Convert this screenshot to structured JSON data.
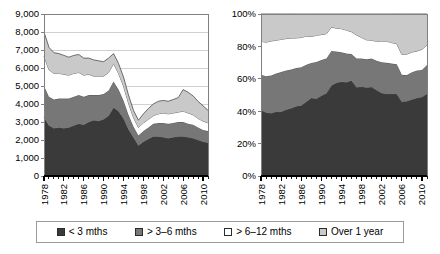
{
  "colors": {
    "series_lt3": "#3a3a3a",
    "series_3to6": "#777777",
    "series_6to12": "#ffffff",
    "series_over1y": "#c9c9c9",
    "axis": "#808080",
    "grid": "#d0d0d0",
    "outline": "#4d4d4d",
    "legend_border": "#9a9a9a"
  },
  "legend": {
    "items": [
      {
        "label": "< 3 mths",
        "swatch": "#3a3a3a",
        "icon": "legend-swatch-icon"
      },
      {
        "label": "> 3–6 mths",
        "swatch": "#777777",
        "icon": "legend-swatch-icon"
      },
      {
        "label": "> 6–12 mths",
        "swatch": "#ffffff",
        "icon": "legend-swatch-icon"
      },
      {
        "label": "Over 1 year",
        "swatch": "#c9c9c9",
        "icon": "legend-swatch-icon"
      }
    ]
  },
  "chart_data": [
    {
      "id": "absolute",
      "type": "area",
      "stacked": true,
      "title": "",
      "xlabel": "",
      "ylabel": "",
      "grid": true,
      "legend_position": "bottom",
      "ylim": [
        0,
        9000
      ],
      "ytick_labels": [
        "0",
        "1,000",
        "2,000",
        "3,000",
        "4,000",
        "5,000",
        "6,000",
        "7,000",
        "8,000",
        "9,000"
      ],
      "yticks": [
        0,
        1000,
        2000,
        3000,
        4000,
        5000,
        6000,
        7000,
        8000,
        9000
      ],
      "xlim": [
        1978,
        2011
      ],
      "xtick_labels": [
        "1978",
        "1982",
        "1986",
        "1990",
        "1994",
        "1998",
        "2002",
        "2006",
        "2010"
      ],
      "xticks": [
        1978,
        1982,
        1986,
        1990,
        1994,
        1998,
        2002,
        2006,
        2010
      ],
      "x": [
        1978,
        1979,
        1980,
        1981,
        1982,
        1983,
        1984,
        1985,
        1986,
        1987,
        1988,
        1989,
        1990,
        1991,
        1992,
        1993,
        1994,
        1995,
        1996,
        1997,
        1998,
        1999,
        2000,
        2001,
        2002,
        2003,
        2004,
        2005,
        2006,
        2007,
        2008,
        2009,
        2010,
        2011
      ],
      "series": [
        {
          "name": "< 3 mths",
          "color": "#3a3a3a",
          "values": [
            3250,
            2800,
            2650,
            2700,
            2650,
            2700,
            2800,
            2900,
            2850,
            3000,
            3100,
            3050,
            3150,
            3350,
            3800,
            3600,
            3200,
            2600,
            2150,
            1700,
            1900,
            2050,
            2200,
            2200,
            2150,
            2100,
            2150,
            2200,
            2200,
            2150,
            2100,
            2000,
            1900,
            1850
          ]
        },
        {
          "name": "> 3–6 mths",
          "color": "#777777",
          "values": [
            1750,
            1600,
            1600,
            1600,
            1650,
            1600,
            1600,
            1600,
            1550,
            1500,
            1400,
            1450,
            1400,
            1400,
            1450,
            1200,
            1000,
            800,
            600,
            550,
            600,
            650,
            700,
            750,
            800,
            800,
            800,
            800,
            800,
            750,
            750,
            700,
            650,
            650
          ]
        },
        {
          "name": "> 6–12 mths",
          "color": "#ffffff",
          "values": [
            1650,
            1500,
            1450,
            1400,
            1350,
            1300,
            1300,
            1250,
            1200,
            1150,
            1050,
            1050,
            1000,
            1000,
            1000,
            900,
            800,
            650,
            500,
            450,
            450,
            450,
            450,
            500,
            550,
            550,
            550,
            550,
            600,
            600,
            550,
            500,
            500,
            450
          ]
        },
        {
          "name": "Over 1 year",
          "color": "#c9c9c9",
          "values": [
            1350,
            1250,
            1150,
            1100,
            1050,
            1000,
            1000,
            1000,
            950,
            900,
            900,
            850,
            800,
            800,
            550,
            550,
            500,
            450,
            400,
            400,
            500,
            600,
            650,
            700,
            700,
            700,
            750,
            800,
            1200,
            1150,
            1050,
            950,
            850,
            700
          ]
        }
      ],
      "totals": [
        8000,
        7150,
        6850,
        6800,
        6700,
        6600,
        6700,
        6750,
        6550,
        6550,
        6450,
        6400,
        6350,
        6550,
        6800,
        6250,
        5500,
        4500,
        3650,
        3100,
        3450,
        3750,
        4000,
        4150,
        4200,
        4150,
        4250,
        4350,
        4800,
        4650,
        4450,
        4150,
        3900,
        3650
      ]
    },
    {
      "id": "percentage",
      "type": "area",
      "stacked": true,
      "normalized": true,
      "title": "",
      "xlabel": "",
      "ylabel": "",
      "grid": false,
      "legend_position": "bottom",
      "ylim": [
        0,
        100
      ],
      "ytick_labels": [
        "0%",
        "20%",
        "40%",
        "60%",
        "80%",
        "100%"
      ],
      "yticks": [
        0,
        20,
        40,
        60,
        80,
        100
      ],
      "xlim": [
        1978,
        2011
      ],
      "xtick_labels": [
        "1978",
        "1982",
        "1986",
        "1990",
        "1994",
        "1998",
        "2002",
        "2006",
        "2010"
      ],
      "xticks": [
        1978,
        1982,
        1986,
        1990,
        1994,
        1998,
        2002,
        2006,
        2010
      ],
      "x": [
        1978,
        1979,
        1980,
        1981,
        1982,
        1983,
        1984,
        1985,
        1986,
        1987,
        1988,
        1989,
        1990,
        1991,
        1992,
        1993,
        1994,
        1995,
        1996,
        1997,
        1998,
        1999,
        2000,
        2001,
        2002,
        2003,
        2004,
        2005,
        2006,
        2007,
        2008,
        2009,
        2010,
        2011
      ],
      "series": [
        {
          "name": "< 3 mths",
          "color": "#3a3a3a",
          "values": [
            40.6,
            39.2,
            38.7,
            39.7,
            39.6,
            40.9,
            41.8,
            43.0,
            43.5,
            45.8,
            48.1,
            47.7,
            49.6,
            51.1,
            55.9,
            57.6,
            58.2,
            57.8,
            58.9,
            54.8,
            55.1,
            54.7,
            55.0,
            53.0,
            51.2,
            50.6,
            50.6,
            50.6,
            45.8,
            46.2,
            47.2,
            48.2,
            48.7,
            50.7
          ]
        },
        {
          "name": "> 3–6 mths",
          "color": "#777777",
          "values": [
            21.9,
            22.4,
            23.4,
            23.5,
            24.6,
            24.2,
            23.9,
            23.7,
            23.7,
            22.9,
            21.7,
            22.7,
            22.0,
            21.4,
            21.3,
            19.2,
            18.2,
            17.8,
            16.4,
            17.7,
            17.4,
            17.3,
            17.5,
            18.1,
            19.0,
            19.3,
            18.8,
            18.4,
            16.7,
            16.1,
            16.9,
            16.9,
            16.7,
            17.8
          ]
        },
        {
          "name": "> 6–12 mths",
          "color": "#ffffff",
          "values": [
            20.6,
            21.0,
            21.2,
            20.6,
            20.1,
            19.7,
            19.4,
            18.5,
            18.3,
            17.6,
            16.3,
            16.4,
            15.7,
            15.3,
            14.7,
            14.4,
            14.5,
            14.4,
            13.7,
            14.5,
            13.0,
            12.0,
            11.3,
            12.0,
            13.1,
            13.3,
            12.9,
            12.6,
            12.5,
            12.9,
            12.4,
            12.0,
            12.8,
            12.3
          ]
        },
        {
          "name": "Over 1 year",
          "color": "#c9c9c9",
          "values": [
            16.9,
            17.4,
            16.7,
            16.2,
            15.7,
            15.2,
            14.9,
            14.8,
            14.5,
            13.7,
            13.9,
            13.2,
            12.7,
            12.2,
            8.1,
            8.8,
            9.1,
            10.0,
            11.0,
            13.0,
            14.5,
            16.0,
            16.2,
            16.9,
            16.7,
            16.8,
            17.7,
            18.4,
            25.0,
            24.8,
            23.5,
            22.9,
            21.8,
            19.2
          ]
        }
      ]
    }
  ]
}
